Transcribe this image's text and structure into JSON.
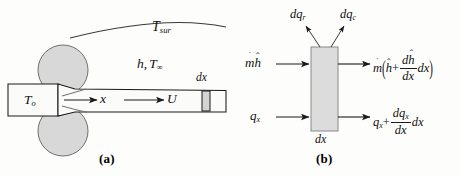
{
  "figure": {
    "panel_a": {
      "caption": "(a)",
      "labels": {
        "surroundings": "T",
        "surroundings_sub": "sur",
        "convection_h": "h",
        "convection_comma": ",",
        "convection_T": "T",
        "convection_sub": "∞",
        "initial_temp": "T",
        "initial_temp_sub": "o",
        "axis_x": "x",
        "velocity_U": "U",
        "element_dx": "dx"
      },
      "icons": {
        "upper_roller": "roller-circle",
        "lower_roller": "roller-circle",
        "surroundings_arc": "arc",
        "strip": "metal-strip",
        "x_arrow": "arrow-right",
        "u_arrow": "arrow-right",
        "dx_element": "shaded-rectangle"
      }
    },
    "panel_b": {
      "caption": "(b)",
      "labels": {
        "dq_radiation": "dq",
        "dq_radiation_sub": "r",
        "dq_convection": "dq",
        "dq_convection_sub": "c",
        "enthalpy_in_mdot": "m",
        "enthalpy_in_h": "h",
        "conduction_in": "q",
        "conduction_in_sub": "x",
        "enthalpy_out_mdot": "m",
        "enthalpy_out_h": "h",
        "enthalpy_out_plus": "+",
        "enthalpy_out_num_d": "d",
        "enthalpy_out_num_h": "h",
        "enthalpy_out_den": "dx",
        "enthalpy_out_dx": "dx",
        "conduction_out_q": "q",
        "conduction_out_sub": "x",
        "conduction_out_plus": "+",
        "conduction_out_num_d": "dq",
        "conduction_out_num_sub": "x",
        "conduction_out_den": "dx",
        "conduction_out_dx": "dx",
        "control_volume_width": "dx"
      },
      "icons": {
        "control_volume": "shaded-rectangle",
        "dq_r_arrow": "arrow-up-left",
        "dq_c_arrow": "arrow-up-right",
        "mh_in_arrow": "arrow-right",
        "qx_in_arrow": "arrow-right",
        "mh_out_arrow": "arrow-right",
        "qx_out_arrow": "arrow-right"
      }
    },
    "colors": {
      "background": "#fdfdfc",
      "line": "#1a1a1a",
      "shading": "#d9d9d9",
      "roller_fill": "#d8d8d8",
      "text": "#111111"
    }
  }
}
